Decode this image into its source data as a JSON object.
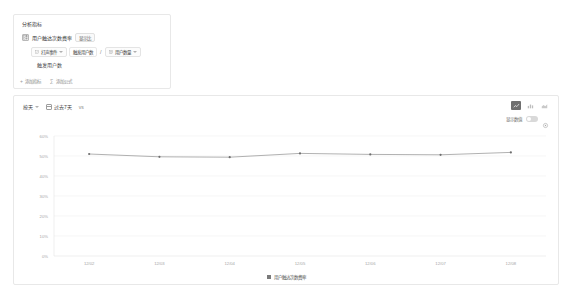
{
  "metrics_panel": {
    "title": "分析指标",
    "metric": {
      "icon": "grid-icon",
      "name": "用户触达次数费率",
      "tag_label": "显示比"
    },
    "formula": {
      "numerator_chip": {
        "icon": "event-icon",
        "label": "打声事件",
        "caret": "chevron-down-icon"
      },
      "numerator_value": "触发用户数",
      "operator": "/",
      "denominator_chip": {
        "icon": "user-icon",
        "label": "用户数量",
        "caret": "chevron-down-icon"
      }
    },
    "sub_metric": "触发用户数",
    "actions": [
      {
        "icon": "plus-icon",
        "label": "添加指标"
      },
      {
        "icon": "sigma-icon",
        "label": "添加公式"
      }
    ]
  },
  "chart_panel": {
    "toolbar": {
      "granularity": {
        "label": "按天",
        "caret": "chevron-down-icon"
      },
      "date_range": {
        "icon": "calendar-icon",
        "label": "过去7天"
      },
      "extra_label": "vs",
      "chart_types": [
        {
          "name": "line-chart-icon",
          "active": true
        },
        {
          "name": "bar-chart-icon",
          "active": false
        },
        {
          "name": "area-chart-icon",
          "active": false
        }
      ],
      "legend_toggle": {
        "label": "显示数值",
        "state": "off"
      },
      "settings_icon": "gear-icon"
    },
    "legend": [
      {
        "swatch_color": "#7a7a7a",
        "label": "用户触达次数费率"
      }
    ]
  },
  "chart_data": {
    "type": "line",
    "title": "",
    "xlabel": "",
    "ylabel": "",
    "ylim": [
      0,
      60
    ],
    "grid": true,
    "legend_position": "bottom",
    "y_ticks": [
      "60%",
      "50%",
      "40%",
      "30%",
      "20%",
      "10%",
      "0%"
    ],
    "y_tick_values": [
      60,
      50,
      40,
      30,
      20,
      10,
      0
    ],
    "categories": [
      "12/02",
      "12/03",
      "12/04",
      "12/05",
      "12/06",
      "12/07",
      "12/08"
    ],
    "series": [
      {
        "name": "用户触达次数费率",
        "color": "#8f8f8f",
        "values": [
          51.0,
          49.6,
          49.4,
          51.3,
          50.8,
          50.6,
          51.8
        ]
      }
    ]
  }
}
